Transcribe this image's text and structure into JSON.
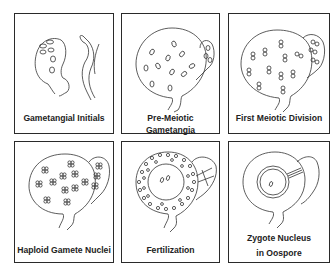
{
  "figure": {
    "panels": [
      {
        "id": "gametangial-initials",
        "caption": "Gametangial Initials"
      },
      {
        "id": "pre-meiotic-gametangia",
        "caption": "Pre-Meiotic Gametangia"
      },
      {
        "id": "first-meiotic-division",
        "caption": "First Meiotic Division"
      },
      {
        "id": "haploid-gamete-nuclei",
        "caption": "Haploid Gamete Nuclei"
      },
      {
        "id": "fertilization",
        "caption": "Fertilization"
      },
      {
        "id": "zygote-nucleus",
        "caption_line1": "Zygote Nucleus",
        "caption_line2": "in Oospore"
      }
    ]
  }
}
